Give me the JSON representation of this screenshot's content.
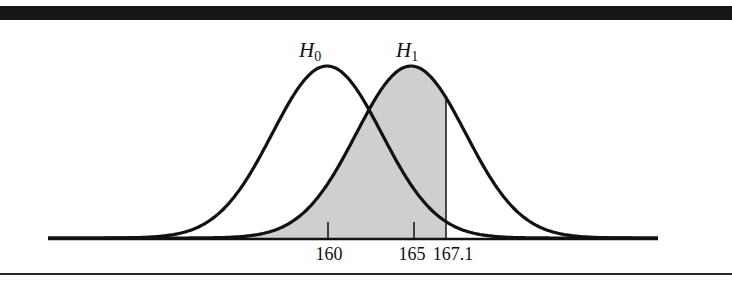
{
  "chart_data": {
    "type": "area",
    "title": "",
    "xlabel": "",
    "ylabel": "",
    "grid": false,
    "legend": null,
    "series": [
      {
        "name": "H0",
        "label_main": "H",
        "label_sub": "0",
        "distribution": "normal",
        "mean": 160,
        "sd": 3.2,
        "shaded": false
      },
      {
        "name": "H1",
        "label_main": "H",
        "label_sub": "1",
        "distribution": "normal",
        "mean": 165,
        "sd": 3.2,
        "shaded": true,
        "shade_region": "x < 167.1"
      }
    ],
    "critical_value": 167.1,
    "x_ticks": [
      160,
      165
    ],
    "x_tick_labels": [
      "160",
      "165",
      "167.1"
    ],
    "xlim": [
      148.5,
      178.5
    ],
    "annotations": [
      {
        "text": "H0",
        "position": "above H0 peak"
      },
      {
        "text": "H1",
        "position": "above H1 peak"
      },
      {
        "text": "167.1",
        "position": "vertical line, critical value"
      }
    ],
    "colors": {
      "curve": "#111111",
      "shade": "#cfcfcf",
      "rule": "#161616"
    }
  },
  "labels": {
    "h0_main": "H",
    "h0_sub": "0",
    "h1_main": "H",
    "h1_sub": "1",
    "tick_160": "160",
    "tick_165": "165",
    "tick_167": "167.1"
  }
}
